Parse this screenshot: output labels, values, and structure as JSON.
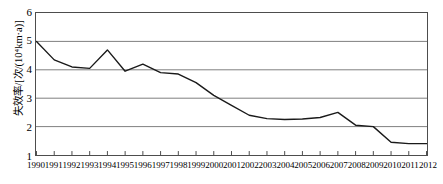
{
  "chart_data": {
    "type": "line",
    "title": "",
    "xlabel": "",
    "ylabel": "失效率/[次/(10⁴km·a)]",
    "ylim": [
      1,
      6
    ],
    "yticks": [
      6,
      5,
      4,
      3,
      2,
      1
    ],
    "grid": true,
    "legend": false,
    "legend_position": "none",
    "line_color": "#1a1a1a",
    "grid_color": "#808080",
    "frame_color": "#4d4d4d",
    "categories": [
      "1990",
      "1991",
      "1992",
      "1993",
      "1994",
      "1995",
      "1996",
      "1997",
      "1998",
      "1999",
      "2000",
      "2001",
      "2002",
      "2003",
      "2004",
      "2005",
      "2006",
      "2007",
      "2008",
      "2009",
      "2010",
      "2011",
      "2012"
    ],
    "series": [
      {
        "name": "失效率",
        "values": [
          5.0,
          4.35,
          4.1,
          4.05,
          4.7,
          3.95,
          4.2,
          3.9,
          3.85,
          3.55,
          3.1,
          2.75,
          2.4,
          2.28,
          2.25,
          2.27,
          2.32,
          2.5,
          2.05,
          2.0,
          1.45,
          1.4,
          1.4
        ]
      }
    ]
  }
}
